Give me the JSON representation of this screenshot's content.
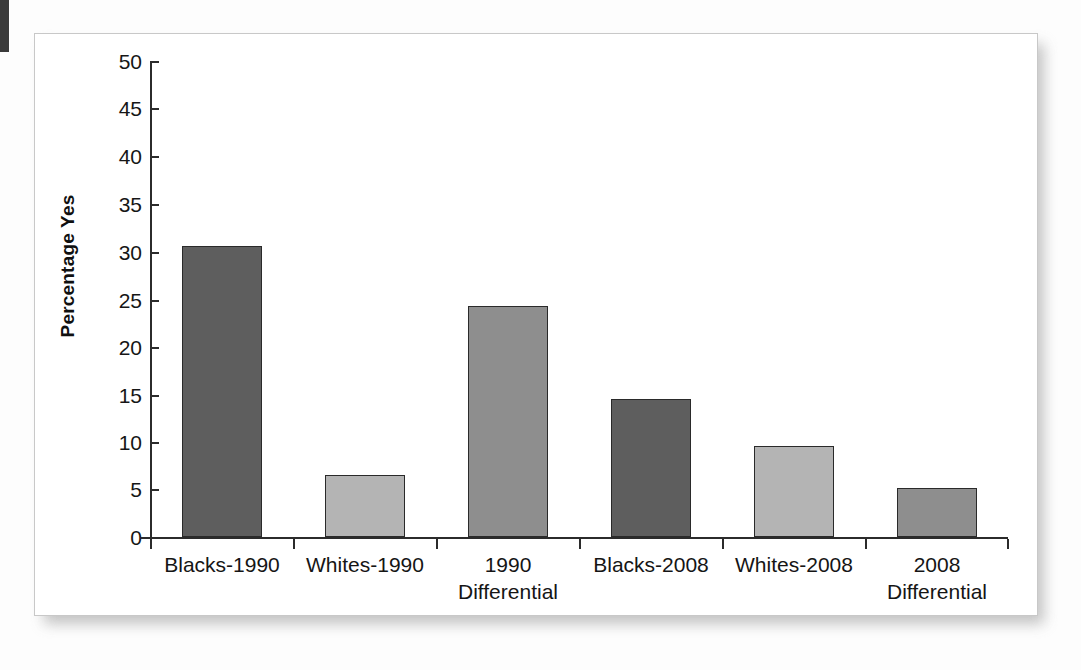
{
  "chart_data": {
    "type": "bar",
    "title": "",
    "xlabel": "",
    "ylabel": "Percentage Yes",
    "ylim": [
      0,
      50
    ],
    "yticks": [
      0,
      5,
      10,
      15,
      20,
      25,
      30,
      35,
      40,
      45,
      50
    ],
    "grid": false,
    "legend": null,
    "categories": [
      "Blacks-1990",
      "Whites-1990",
      "1990 Differential",
      "Blacks-2008",
      "Whites-2008",
      "2008 Differential"
    ],
    "category_lines": [
      [
        "Blacks-1990",
        ""
      ],
      [
        "Whites-1990",
        ""
      ],
      [
        "1990",
        "Differential"
      ],
      [
        "Blacks-2008",
        ""
      ],
      [
        "Whites-2008",
        ""
      ],
      [
        "2008",
        "Differential"
      ]
    ],
    "values": [
      30.6,
      6.5,
      24.3,
      14.5,
      9.6,
      5.2
    ],
    "bar_colors": [
      "#5e5e5e",
      "#b4b4b4",
      "#8e8e8e",
      "#5e5e5e",
      "#b4b4b4",
      "#8e8e8e"
    ]
  },
  "axis": {
    "y_title": "Percentage Yes",
    "tick_0": "0",
    "tick_5": "5",
    "tick_10": "10",
    "tick_15": "15",
    "tick_20": "20",
    "tick_25": "25",
    "tick_30": "30",
    "tick_35": "35",
    "tick_40": "40",
    "tick_45": "45",
    "tick_50": "50"
  },
  "categories_text": {
    "c0_l1": "Blacks-1990",
    "c0_l2": "",
    "c1_l1": "Whites-1990",
    "c1_l2": "",
    "c2_l1": "1990",
    "c2_l2": "Differential",
    "c3_l1": "Blacks-2008",
    "c3_l2": "",
    "c4_l1": "Whites-2008",
    "c4_l2": "",
    "c5_l1": "2008",
    "c5_l2": "Differential"
  }
}
